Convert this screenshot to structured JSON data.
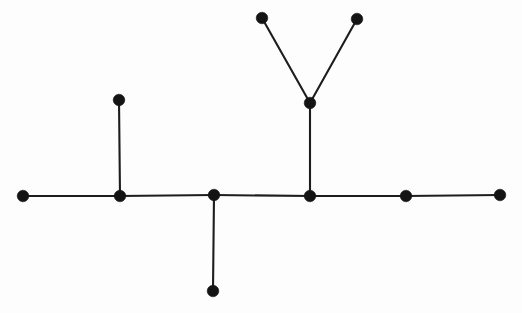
{
  "figure": {
    "kind": "graph-diagram",
    "background_color": "#fdfdfd",
    "node_color": "#141414",
    "edge_color": "#1d1d1d",
    "edge_width": 2.1,
    "node_radius": 5.8,
    "canvas": {
      "width": 522,
      "height": 313
    }
  },
  "chart_data": {
    "type": "scatter",
    "title": "",
    "xlabel": "",
    "ylabel": "",
    "xlim": [
      0,
      522
    ],
    "ylim": [
      0,
      313
    ],
    "grid": false,
    "legend": "none",
    "node_count": 11,
    "edge_count": 10,
    "nodes": [
      {
        "id": "n1",
        "name": "left-endpoint",
        "x": 23,
        "y": 196,
        "degree": 1
      },
      {
        "id": "n2",
        "name": "left-junction",
        "x": 120,
        "y": 196,
        "degree": 3
      },
      {
        "id": "n3",
        "name": "left-branch-tip",
        "x": 119,
        "y": 100,
        "degree": 1
      },
      {
        "id": "n4",
        "name": "middle-junction",
        "x": 214,
        "y": 195,
        "degree": 3
      },
      {
        "id": "n5",
        "name": "lower-branch-tip",
        "x": 213,
        "y": 291,
        "degree": 1
      },
      {
        "id": "n6",
        "name": "right-junction",
        "x": 310,
        "y": 196,
        "degree": 3
      },
      {
        "id": "n7",
        "name": "vee-vertex",
        "x": 310,
        "y": 103,
        "degree": 3
      },
      {
        "id": "n8",
        "name": "vee-left-tip",
        "x": 262,
        "y": 18,
        "degree": 1
      },
      {
        "id": "n9",
        "name": "vee-right-tip",
        "x": 357,
        "y": 19,
        "degree": 1
      },
      {
        "id": "n10",
        "name": "right-path-node",
        "x": 406,
        "y": 196,
        "degree": 2
      },
      {
        "id": "n11",
        "name": "right-endpoint",
        "x": 500,
        "y": 195,
        "degree": 1
      }
    ],
    "edges": [
      {
        "id": "e1",
        "name": "edge-n1-n2",
        "from": "n1",
        "to": "n2",
        "x1": 23,
        "y1": 196,
        "x2": 120,
        "y2": 196
      },
      {
        "id": "e2",
        "name": "edge-n2-n3",
        "from": "n2",
        "to": "n3",
        "x1": 120,
        "y1": 196,
        "x2": 119,
        "y2": 100
      },
      {
        "id": "e3",
        "name": "edge-n2-n4",
        "from": "n2",
        "to": "n4",
        "x1": 120,
        "y1": 196,
        "x2": 214,
        "y2": 195
      },
      {
        "id": "e4",
        "name": "edge-n4-n5",
        "from": "n4",
        "to": "n5",
        "x1": 214,
        "y1": 195,
        "x2": 213,
        "y2": 291
      },
      {
        "id": "e5",
        "name": "edge-n4-n6",
        "from": "n4",
        "to": "n6",
        "x1": 214,
        "y1": 195,
        "x2": 310,
        "y2": 196
      },
      {
        "id": "e6",
        "name": "edge-n6-n7",
        "from": "n6",
        "to": "n7",
        "x1": 310,
        "y1": 196,
        "x2": 310,
        "y2": 103
      },
      {
        "id": "e7",
        "name": "edge-n7-n8",
        "from": "n7",
        "to": "n8",
        "x1": 310,
        "y1": 103,
        "x2": 262,
        "y2": 18
      },
      {
        "id": "e8",
        "name": "edge-n7-n9",
        "from": "n7",
        "to": "n9",
        "x1": 310,
        "y1": 103,
        "x2": 357,
        "y2": 19
      },
      {
        "id": "e9",
        "name": "edge-n6-n10",
        "from": "n6",
        "to": "n10",
        "x1": 310,
        "y1": 196,
        "x2": 406,
        "y2": 196
      },
      {
        "id": "e10",
        "name": "edge-n10-n11",
        "from": "n10",
        "to": "n11",
        "x1": 406,
        "y1": 196,
        "x2": 500,
        "y2": 195
      }
    ]
  }
}
